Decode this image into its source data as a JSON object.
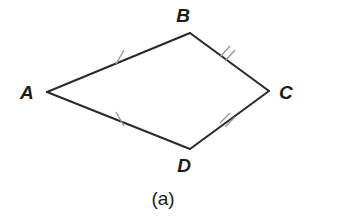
{
  "figure": {
    "caption": "(a)",
    "shape_name": "quadrilateral-abcd",
    "background_color": "#ffffff",
    "edge_color": "#2b2b2b",
    "tick_color": "#9a9a9a",
    "label_color": "#1c1c1c",
    "vertices": [
      {
        "label": "A",
        "x": 47,
        "y": 92,
        "label_x": 20,
        "label_y": 99
      },
      {
        "label": "B",
        "x": 190,
        "y": 33,
        "label_x": 183,
        "label_y": 22
      },
      {
        "label": "C",
        "x": 269,
        "y": 91,
        "label_x": 279,
        "label_y": 99
      },
      {
        "label": "D",
        "x": 190,
        "y": 149,
        "label_x": 183,
        "label_y": 172
      }
    ],
    "edges": [
      {
        "name": "edge-ab",
        "from": "A",
        "to": "B",
        "ticks": 1
      },
      {
        "name": "edge-bc",
        "from": "B",
        "to": "C",
        "ticks": 2
      },
      {
        "name": "edge-cd",
        "from": "C",
        "to": "D",
        "ticks": 2
      },
      {
        "name": "edge-da",
        "from": "D",
        "to": "A",
        "ticks": 1
      }
    ],
    "congruence_marks": [
      {
        "name": "tick-ab",
        "edge": "AB",
        "count": 1,
        "cx": 120,
        "cy": 57
      },
      {
        "name": "tick-bc",
        "edge": "BC",
        "count": 2,
        "cx": 227,
        "cy": 58
      },
      {
        "name": "tick-cd",
        "edge": "CD",
        "count": 2,
        "cx": 227,
        "cy": 122
      },
      {
        "name": "tick-da",
        "edge": "DA",
        "count": 1,
        "cx": 120,
        "cy": 119
      }
    ],
    "caption_x": 163,
    "caption_y": 205
  }
}
